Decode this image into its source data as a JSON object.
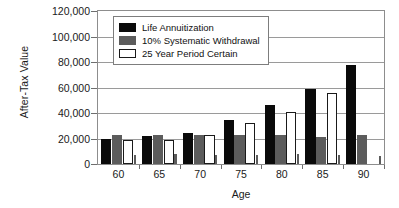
{
  "chart_data": {
    "type": "bar",
    "title": "",
    "xlabel": "Age",
    "ylabel": "After-Tax Value",
    "categories": [
      "60",
      "65",
      "70",
      "75",
      "80",
      "85",
      "90"
    ],
    "ylim": [
      0,
      120000
    ],
    "ytick_labels": [
      "120,000",
      "100,000",
      "80,000",
      "60,000",
      "40,000",
      "20,000",
      "0"
    ],
    "ytick_values": [
      120000,
      100000,
      80000,
      60000,
      40000,
      20000,
      0
    ],
    "grid": true,
    "legend_position": "upper-left-inside",
    "series": [
      {
        "name": "Life Annuitization",
        "color": "#0a0a0a",
        "values": [
          19500,
          22000,
          24500,
          34500,
          46000,
          59000,
          78000
        ]
      },
      {
        "name": "10% Systematic Withdrawal",
        "color": "#5c5c5c",
        "values": [
          22500,
          22500,
          22500,
          22500,
          22500,
          21000,
          22500
        ]
      },
      {
        "name": "25 Year Period Certain",
        "color": "#ffffff",
        "values": [
          18500,
          19000,
          22500,
          32000,
          41000,
          56000,
          0
        ]
      },
      {
        "name": "",
        "color": "#5c5c5c",
        "values": [
          7000,
          7500,
          7000,
          7000,
          7500,
          7000,
          6500
        ]
      }
    ]
  },
  "legend": {
    "entries": [
      {
        "label": "Life Annuitization",
        "swatch": "s0"
      },
      {
        "label": "10% Systematic Withdrawal",
        "swatch": "s1"
      },
      {
        "label": "25 Year Period Certain",
        "swatch": "s2"
      }
    ]
  }
}
